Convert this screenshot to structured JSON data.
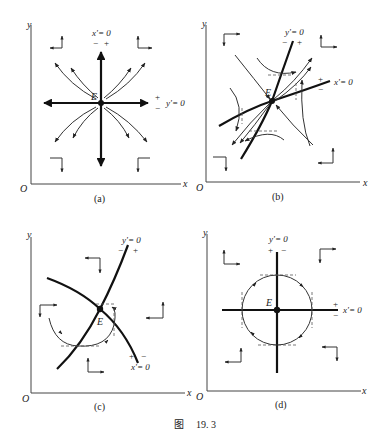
{
  "figure": {
    "caption_prefix": "图",
    "caption_number": "19. 3"
  },
  "panels": [
    {
      "id": "a",
      "label": "(a)",
      "axis_x": "x",
      "axis_y": "y",
      "origin": "O",
      "equilibrium": "E",
      "nullcline_1": "x'= 0",
      "nullcline_1_signs": [
        "−",
        "+"
      ],
      "nullcline_2": "y'= 0",
      "nullcline_2_signs": [
        "+",
        "−"
      ],
      "type": "unstable node"
    },
    {
      "id": "b",
      "label": "(b)",
      "axis_x": "x",
      "axis_y": "y",
      "origin": "O",
      "equilibrium": "E",
      "nullcline_1": "y'= 0",
      "nullcline_1_signs": [
        "−",
        "+"
      ],
      "nullcline_2": "x'= 0",
      "nullcline_2_signs": [
        "+",
        "−"
      ],
      "type": "saddle point"
    },
    {
      "id": "c",
      "label": "(c)",
      "axis_x": "x",
      "axis_y": "y",
      "origin": "O",
      "equilibrium": "E",
      "nullcline_1": "y'= 0",
      "nullcline_1_signs": [
        "−",
        "+"
      ],
      "nullcline_2": "x'= 0",
      "nullcline_2_signs": [
        "+",
        "−"
      ],
      "type": "spiral / focus"
    },
    {
      "id": "d",
      "label": "(d)",
      "axis_x": "x",
      "axis_y": "y",
      "origin": "O",
      "equilibrium": "E",
      "nullcline_1": "y'= 0",
      "nullcline_1_signs": [
        "+",
        "−"
      ],
      "nullcline_2": "x'= 0",
      "nullcline_2_signs": [
        "+",
        "−"
      ],
      "type": "center"
    }
  ]
}
